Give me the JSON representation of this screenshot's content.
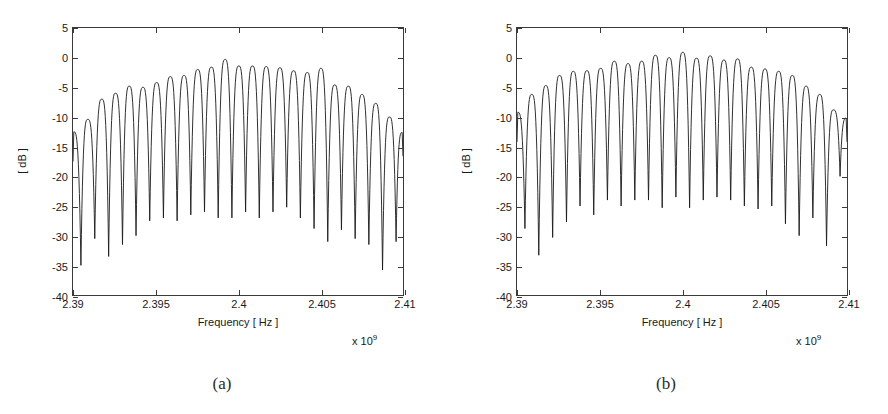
{
  "figure": {
    "background": "#ffffff",
    "line_color": "#1a1a1a",
    "axis_color": "#3a3a3a",
    "grid": false
  },
  "panels": [
    {
      "caption": "(a)",
      "chart_ref": 0
    },
    {
      "caption": "(b)",
      "chart_ref": 1
    }
  ],
  "chart_data": [
    {
      "type": "line",
      "title": "",
      "xlabel": "Frequency [ Hz ]",
      "ylabel": "[ dB ]",
      "x_exponent_label": "x 10",
      "x_exponent_value": "9",
      "xlim": [
        2.39,
        2.41
      ],
      "ylim": [
        -40,
        5
      ],
      "xticks": [
        2.39,
        2.395,
        2.4,
        2.405,
        2.41
      ],
      "xticklabels": [
        "2.39",
        "2.395",
        "2.4",
        "2.405",
        "2.41"
      ],
      "yticks": [
        5,
        0,
        -5,
        -10,
        -15,
        -20,
        -25,
        -30,
        -35,
        -40
      ],
      "yticklabels": [
        "5",
        "0",
        "-5",
        "-10",
        "-15",
        "-20",
        "-25",
        "-30",
        "-35",
        "-40"
      ],
      "grid": false,
      "legend": null,
      "description": "Comb-shaped multi-carrier spectrum with 24 passband lobes between 2.39 and 2.41 GHz; envelope peaks near 0 dB at 2.399 GHz and rolls off to about -13 dB at both band edges; nulls between lobes reach -25 to -36 dB.",
      "n_lobes": 24,
      "lobe_spacing_hz": 0.00083,
      "envelope_peak_db": 0,
      "envelope_edge_db": -13,
      "peaks": [
        {
          "x": 2.39005,
          "y": -12.5
        },
        {
          "x": 2.3909,
          "y": -10.4
        },
        {
          "x": 2.39175,
          "y": -7.0
        },
        {
          "x": 2.39258,
          "y": -6.0
        },
        {
          "x": 2.39341,
          "y": -4.8
        },
        {
          "x": 2.39424,
          "y": -5.0
        },
        {
          "x": 2.39507,
          "y": -4.2
        },
        {
          "x": 2.3959,
          "y": -3.2
        },
        {
          "x": 2.39673,
          "y": -3.0
        },
        {
          "x": 2.39756,
          "y": -2.0
        },
        {
          "x": 2.39839,
          "y": -1.6
        },
        {
          "x": 2.39922,
          "y": -0.3
        },
        {
          "x": 2.40005,
          "y": -1.4
        },
        {
          "x": 2.40088,
          "y": -1.4
        },
        {
          "x": 2.40171,
          "y": -1.5
        },
        {
          "x": 2.40254,
          "y": -1.7
        },
        {
          "x": 2.40337,
          "y": -2.2
        },
        {
          "x": 2.4042,
          "y": -2.5
        },
        {
          "x": 2.40503,
          "y": -1.8
        },
        {
          "x": 2.40586,
          "y": -4.6
        },
        {
          "x": 2.40669,
          "y": -4.8
        },
        {
          "x": 2.40752,
          "y": -6.2
        },
        {
          "x": 2.40835,
          "y": -7.7
        },
        {
          "x": 2.40918,
          "y": -10.0
        },
        {
          "x": 2.40995,
          "y": -12.6
        }
      ],
      "nulls": [
        {
          "x": 2.39048,
          "y": -35.0
        },
        {
          "x": 2.39132,
          "y": -30.5
        },
        {
          "x": 2.39216,
          "y": -33.5
        },
        {
          "x": 2.393,
          "y": -31.5
        },
        {
          "x": 2.39382,
          "y": -30.0
        },
        {
          "x": 2.39465,
          "y": -27.5
        },
        {
          "x": 2.39548,
          "y": -27.0
        },
        {
          "x": 2.39631,
          "y": -27.5
        },
        {
          "x": 2.39714,
          "y": -26.5
        },
        {
          "x": 2.39797,
          "y": -26.0
        },
        {
          "x": 2.3988,
          "y": -27.0
        },
        {
          "x": 2.39963,
          "y": -27.0
        },
        {
          "x": 2.40046,
          "y": -26.0
        },
        {
          "x": 2.40129,
          "y": -27.0
        },
        {
          "x": 2.40212,
          "y": -26.0
        },
        {
          "x": 2.40295,
          "y": -25.2
        },
        {
          "x": 2.40378,
          "y": -27.0
        },
        {
          "x": 2.40461,
          "y": -28.8
        },
        {
          "x": 2.40544,
          "y": -31.0
        },
        {
          "x": 2.40627,
          "y": -29.0
        },
        {
          "x": 2.4071,
          "y": -30.5
        },
        {
          "x": 2.40793,
          "y": -31.5
        },
        {
          "x": 2.40876,
          "y": -35.8
        },
        {
          "x": 2.40958,
          "y": -31.0
        }
      ]
    },
    {
      "type": "line",
      "title": "",
      "xlabel": "Frequency [ Hz ]",
      "ylabel": "[ dB ]",
      "x_exponent_label": "x 10",
      "x_exponent_value": "9",
      "xlim": [
        2.39,
        2.41
      ],
      "ylim": [
        -40,
        5
      ],
      "xticks": [
        2.39,
        2.395,
        2.4,
        2.405,
        2.41
      ],
      "xticklabels": [
        "2.39",
        "2.395",
        "2.4",
        "2.405",
        "2.41"
      ],
      "yticks": [
        5,
        0,
        -5,
        -10,
        -15,
        -20,
        -25,
        -30,
        -35,
        -40
      ],
      "yticklabels": [
        "5",
        "0",
        "-5",
        "-10",
        "-15",
        "-20",
        "-25",
        "-30",
        "-35",
        "-40"
      ],
      "grid": false,
      "legend": null,
      "description": "Comb-shaped multi-carrier spectrum with 24 passband lobes between 2.39 and 2.41 GHz; flatter envelope than (a), peaking near +1 dB around 2.4005 GHz and rolling off to about -9 dB at the band edges; nulls between lobes reach -25 to -33 dB.",
      "n_lobes": 24,
      "lobe_spacing_hz": 0.00083,
      "envelope_peak_db": 1,
      "envelope_edge_db": -9,
      "peaks": [
        {
          "x": 2.39005,
          "y": -9.2
        },
        {
          "x": 2.3909,
          "y": -6.2
        },
        {
          "x": 2.39175,
          "y": -4.7
        },
        {
          "x": 2.39258,
          "y": -3.0
        },
        {
          "x": 2.39341,
          "y": -2.3
        },
        {
          "x": 2.39424,
          "y": -2.2
        },
        {
          "x": 2.39507,
          "y": -1.8
        },
        {
          "x": 2.3959,
          "y": -0.6
        },
        {
          "x": 2.39673,
          "y": -1.0
        },
        {
          "x": 2.39756,
          "y": -0.6
        },
        {
          "x": 2.39839,
          "y": 0.4
        },
        {
          "x": 2.39922,
          "y": 0.0
        },
        {
          "x": 2.40005,
          "y": 0.9
        },
        {
          "x": 2.40088,
          "y": -0.1
        },
        {
          "x": 2.40171,
          "y": 0.3
        },
        {
          "x": 2.40254,
          "y": -0.4
        },
        {
          "x": 2.40337,
          "y": -0.2
        },
        {
          "x": 2.4042,
          "y": -1.6
        },
        {
          "x": 2.40503,
          "y": -1.9
        },
        {
          "x": 2.40586,
          "y": -2.3
        },
        {
          "x": 2.40669,
          "y": -3.0
        },
        {
          "x": 2.40752,
          "y": -4.8
        },
        {
          "x": 2.40835,
          "y": -6.2
        },
        {
          "x": 2.40918,
          "y": -8.8
        },
        {
          "x": 2.40995,
          "y": -10.2
        }
      ],
      "nulls": [
        {
          "x": 2.39048,
          "y": -28.8
        },
        {
          "x": 2.39132,
          "y": -33.3
        },
        {
          "x": 2.39216,
          "y": -30.3
        },
        {
          "x": 2.393,
          "y": -27.7
        },
        {
          "x": 2.39382,
          "y": -25.0
        },
        {
          "x": 2.39465,
          "y": -26.5
        },
        {
          "x": 2.39548,
          "y": -24.0
        },
        {
          "x": 2.39631,
          "y": -25.0
        },
        {
          "x": 2.39714,
          "y": -24.0
        },
        {
          "x": 2.39797,
          "y": -24.0
        },
        {
          "x": 2.3988,
          "y": -25.3
        },
        {
          "x": 2.39963,
          "y": -23.5
        },
        {
          "x": 2.40046,
          "y": -25.3
        },
        {
          "x": 2.40129,
          "y": -24.0
        },
        {
          "x": 2.40212,
          "y": -23.5
        },
        {
          "x": 2.40295,
          "y": -24.0
        },
        {
          "x": 2.40378,
          "y": -25.0
        },
        {
          "x": 2.40461,
          "y": -25.5
        },
        {
          "x": 2.40544,
          "y": -25.0
        },
        {
          "x": 2.40627,
          "y": -28.0
        },
        {
          "x": 2.4071,
          "y": -30.0
        },
        {
          "x": 2.40793,
          "y": -27.0
        },
        {
          "x": 2.40876,
          "y": -31.7
        },
        {
          "x": 2.40958,
          "y": -20.0
        }
      ]
    }
  ]
}
